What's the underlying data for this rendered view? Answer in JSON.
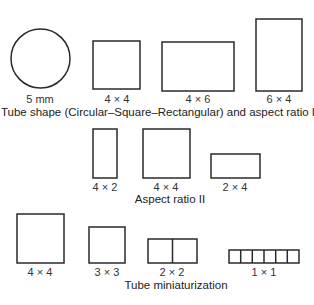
{
  "sections": [
    {
      "caption": "Tube shape (Circular–Square–Rectangular) and aspect ratio I",
      "items": [
        {
          "shape": "circle",
          "label": "5 mm"
        },
        {
          "shape": "square",
          "label": "4 × 4"
        },
        {
          "shape": "rectangle-wide",
          "label": "4 × 6"
        },
        {
          "shape": "rectangle-tall",
          "label": "6 × 4"
        }
      ]
    },
    {
      "caption": "Aspect ratio II",
      "items": [
        {
          "shape": "rectangle-tall",
          "label": "4 × 2"
        },
        {
          "shape": "square",
          "label": "4 × 4"
        },
        {
          "shape": "rectangle-wide",
          "label": "2 × 4"
        }
      ]
    },
    {
      "caption": "Tube miniaturization",
      "items": [
        {
          "shape": "square",
          "label": "4 × 4",
          "cells": 1
        },
        {
          "shape": "square",
          "label": "3 × 3",
          "cells": 1
        },
        {
          "shape": "split-rectangle",
          "label": "2 × 2",
          "cells": 2
        },
        {
          "shape": "split-strip",
          "label": "1 × 1",
          "cells": 6
        }
      ]
    }
  ],
  "colors": {
    "stroke": "#2a2a2a",
    "background": "#ffffff"
  }
}
